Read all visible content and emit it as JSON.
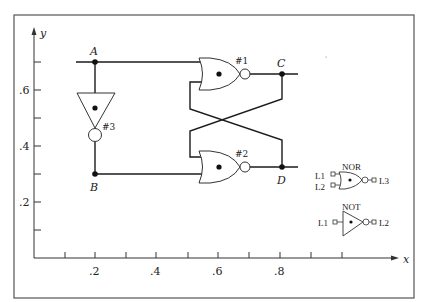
{
  "figure": {
    "axes": {
      "x_label": "x",
      "y_label": "y",
      "x_ticks": [
        ".2",
        ".4",
        ".6",
        ".8"
      ],
      "y_ticks": [
        ".6",
        ".4",
        ".2"
      ]
    },
    "nodes": {
      "A": "A",
      "B": "B",
      "C": "C",
      "D": "D"
    },
    "gates": {
      "g1": "#1",
      "g2": "#2",
      "g3": "#3"
    },
    "legend": {
      "nor_title": "NOR",
      "nor_in1": "L1",
      "nor_in2": "L2",
      "nor_out": "L3",
      "not_title": "NOT",
      "not_in": "L1",
      "not_out": "L2"
    },
    "colors": {
      "line": "#1a1a1a",
      "frame": "#555555",
      "background": "#ffffff"
    }
  }
}
